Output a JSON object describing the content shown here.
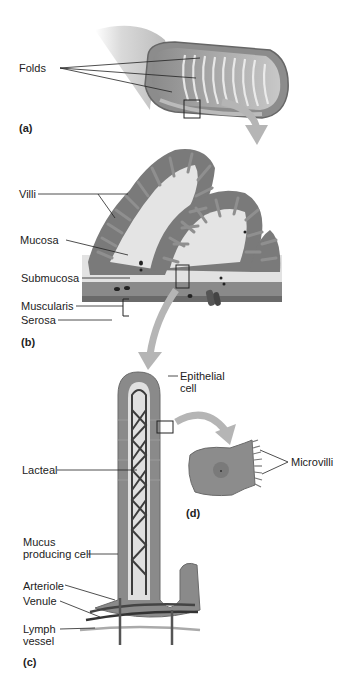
{
  "figure": {
    "panels": {
      "a": "(a)",
      "b": "(b)",
      "c": "(c)",
      "d": "(d)"
    },
    "labels": {
      "folds": "Folds",
      "villi": "Villi",
      "mucosa": "Mucosa",
      "submucosa": "Submucosa",
      "muscularis": "Muscularis",
      "serosa": "Serosa",
      "epithelial_1": "Epithelial",
      "epithelial_2": "cell",
      "lacteal": "Lacteal",
      "microvilli": "Microvilli",
      "mucus_1": "Mucus",
      "mucus_2": "producing cell",
      "arteriole": "Arteriole",
      "venule": "Venule",
      "lymph_1": "Lymph",
      "lymph_2": "vessel"
    },
    "colors": {
      "tissue_dark": "#6e6e6e",
      "tissue_mid": "#9a9a9a",
      "tissue_light": "#d6d6d6",
      "arrow": "#b5b5b5",
      "line": "#222222"
    }
  }
}
